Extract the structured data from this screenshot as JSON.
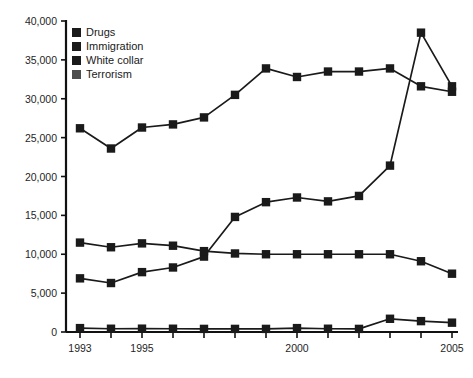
{
  "chart_data": {
    "type": "line",
    "title": "",
    "subtitle": "",
    "xlabel": "",
    "ylabel": "",
    "grid": false,
    "legend_position": "top-left",
    "x": [
      1993,
      1994,
      1995,
      1996,
      1997,
      1998,
      1999,
      2000,
      2001,
      2002,
      2003,
      2004,
      2005
    ],
    "categories": [
      "1993",
      "1994",
      "1995",
      "1996",
      "1997",
      "1998",
      "1999",
      "2000",
      "2001",
      "2002",
      "2003",
      "2004",
      "2005"
    ],
    "xlim": [
      1993,
      2005
    ],
    "ylim": [
      0,
      40000
    ],
    "y_ticks": [
      0,
      5000,
      10000,
      15000,
      20000,
      25000,
      30000,
      35000,
      40000
    ],
    "y_tick_labels": [
      "0",
      "5,000",
      "10,000",
      "15,000",
      "20,000",
      "25,000",
      "30,000",
      "35,000",
      "40,000"
    ],
    "x_ticks": [
      1993,
      1994,
      1995,
      1996,
      1997,
      1998,
      1999,
      2000,
      2001,
      2002,
      2003,
      2004,
      2005
    ],
    "x_tick_labels": [
      "1993",
      "",
      "1995",
      "",
      "",
      "",
      "",
      "2000",
      "",
      "",
      "",
      "",
      "2005"
    ],
    "x_tick_labels_visible": [
      "1993",
      "1995",
      "2000",
      "2005"
    ],
    "series": [
      {
        "name": "Drugs",
        "color": "#1a1a1a",
        "marker": "square",
        "values": [
          26200,
          23600,
          26300,
          26700,
          27600,
          30500,
          33900,
          32800,
          33500,
          33500,
          33900,
          31600,
          30900
        ]
      },
      {
        "name": "Immigration",
        "color": "#1a1a1a",
        "marker": "square",
        "values": [
          6900,
          6300,
          7700,
          8300,
          9700,
          14800,
          16700,
          17300,
          16800,
          17500,
          21400,
          38500,
          31600
        ]
      },
      {
        "name": "White collar",
        "color": "#1a1a1a",
        "marker": "square",
        "values": [
          11500,
          10900,
          11400,
          11100,
          10400,
          10100,
          10000,
          10000,
          10000,
          10000,
          10000,
          9100,
          7500
        ]
      },
      {
        "name": "Terrorism",
        "color": "#1a1a1a",
        "marker": "square",
        "values": [
          500,
          420,
          430,
          420,
          400,
          400,
          400,
          500,
          420,
          400,
          1700,
          1400,
          1200
        ]
      }
    ]
  },
  "legend": {
    "items": [
      {
        "label": "Drugs",
        "color": "#1a1a1a"
      },
      {
        "label": "Immigration",
        "color": "#1a1a1a"
      },
      {
        "label": "White collar",
        "color": "#1a1a1a"
      },
      {
        "label": "Terrorism",
        "color": "#4d4d4d"
      }
    ]
  },
  "axis": {
    "line_color": "#111111"
  }
}
